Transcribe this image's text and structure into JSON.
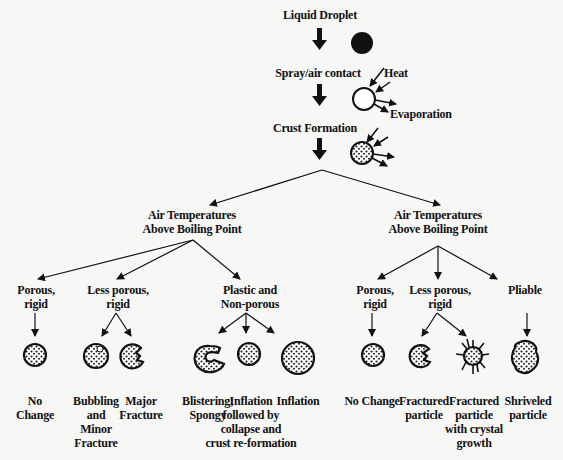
{
  "stages": {
    "droplet": "Liquid Droplet",
    "spray": "Spray/air contact",
    "heat": "Heat",
    "evaporation": "Evaporation",
    "crust": "Crust Formation"
  },
  "branches": {
    "left": {
      "title_line1": "Air Temperatures",
      "title_line2": "Above Boiling Point",
      "categories": [
        {
          "line1": "Porous,",
          "line2": "rigid"
        },
        {
          "line1": "Less porous,",
          "line2": "rigid"
        },
        {
          "line1": "Plastic and",
          "line2": "Non-porous"
        }
      ],
      "outcomes": [
        {
          "lines": [
            "No",
            "Change"
          ]
        },
        {
          "lines": [
            "Bubbling",
            "and",
            "Minor",
            "Fracture"
          ]
        },
        {
          "lines": [
            "Major",
            "Fracture"
          ]
        },
        {
          "lines": [
            "Blistering;",
            "Spongy"
          ]
        },
        {
          "lines": [
            "Inflation",
            "followed by",
            "collapse and",
            "crust re-formation"
          ]
        },
        {
          "lines": [
            "Inflation"
          ]
        }
      ]
    },
    "right": {
      "title_line1": "Air Temperatures",
      "title_line2": "Above Boiling Point",
      "categories": [
        {
          "line1": "Porous,",
          "line2": "rigid"
        },
        {
          "line1": "Less porous,",
          "line2": "rigid"
        },
        {
          "line1": "Pliable",
          "line2": ""
        }
      ],
      "outcomes": [
        {
          "lines": [
            "No Change"
          ]
        },
        {
          "lines": [
            "Fractured",
            "particle"
          ]
        },
        {
          "lines": [
            "Fractured",
            "particle",
            "with crystal",
            "growth"
          ]
        },
        {
          "lines": [
            "Shriveled",
            "particle"
          ]
        }
      ]
    }
  }
}
